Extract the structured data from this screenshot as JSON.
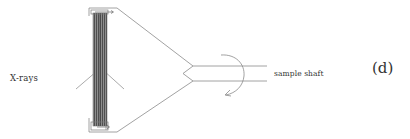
{
  "figure": {
    "panel_label": "(d)",
    "labels": {
      "xrays": "X-rays",
      "shaft": "sample shaft"
    },
    "colors": {
      "line": "#8a8a8a",
      "plate_dark": "#5a5a5a",
      "plate_light": "#9a9a9a",
      "text": "#333333",
      "background": "#ffffff"
    },
    "components": [
      "sample-plate",
      "top-clamp",
      "bottom-clamp",
      "triangular-holder",
      "sample-shaft",
      "rotation-arrow",
      "x-ray-beam"
    ]
  }
}
